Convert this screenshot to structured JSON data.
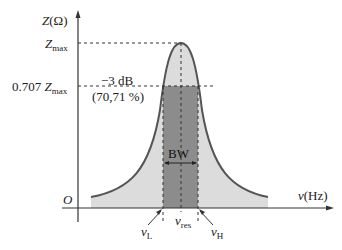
{
  "diagram": {
    "y_axis": {
      "label": "Z",
      "unit": "(Ω)"
    },
    "x_axis": {
      "label": "ν",
      "unit": "(Hz)"
    },
    "origin": "O",
    "levels": {
      "zmax": {
        "main": "Z",
        "sub": "max"
      },
      "z707": {
        "prefix": "0.707 ",
        "main": "Z",
        "sub": "max"
      }
    },
    "annotation": {
      "line1": "−3 dB",
      "line2": "(70,71 %)"
    },
    "bandwidth_label": "BW",
    "freq_labels": {
      "low": {
        "main": "ν",
        "sub": "L"
      },
      "res": {
        "main": "ν",
        "sub": "res"
      },
      "high": {
        "main": "ν",
        "sub": "H"
      }
    },
    "colors": {
      "curve": "#555555",
      "fill_light": "#dcdcdc",
      "fill_dark": "#8c8c8c",
      "axis": "#333333"
    }
  }
}
